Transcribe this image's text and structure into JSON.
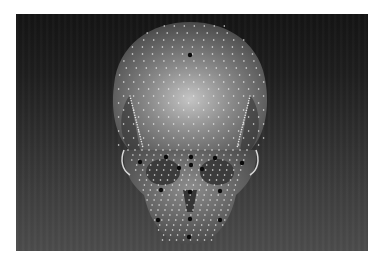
{
  "image": {
    "description": "Frontal view of a 3D skull model covered with small white landmark dots and larger black anatomical landmark points",
    "colors": {
      "background_top": "#141414",
      "background_bottom": "#4c4c4c",
      "skull_light": "#bdbdbd",
      "skull_mid": "#7a7a7a",
      "skull_dark": "#3a3a3a",
      "dot_white": "#e6e6e6",
      "dot_black": "#0a0a0a"
    },
    "black_landmarks": [
      {
        "x": 190,
        "y": 55
      },
      {
        "x": 140,
        "y": 162
      },
      {
        "x": 166,
        "y": 157
      },
      {
        "x": 191,
        "y": 157
      },
      {
        "x": 215,
        "y": 158
      },
      {
        "x": 242,
        "y": 163
      },
      {
        "x": 191,
        "y": 165
      },
      {
        "x": 179,
        "y": 168
      },
      {
        "x": 202,
        "y": 169
      },
      {
        "x": 161,
        "y": 190
      },
      {
        "x": 190,
        "y": 192
      },
      {
        "x": 220,
        "y": 191
      },
      {
        "x": 158,
        "y": 220
      },
      {
        "x": 190,
        "y": 219
      },
      {
        "x": 220,
        "y": 220
      },
      {
        "x": 189,
        "y": 237
      }
    ]
  }
}
